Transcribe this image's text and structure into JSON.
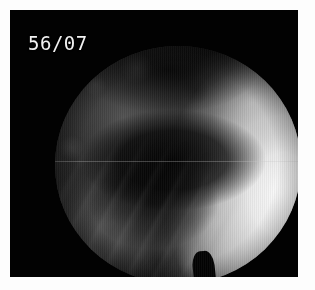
{
  "image": {
    "kind": "endoscopic-still-frame",
    "border_color": "#fdfdfd",
    "frame_color": "#020202"
  },
  "overlay": {
    "counter": "56/07",
    "counter_color": "#f2f2f2"
  },
  "scope_view": {
    "label": "circular endoscopic field of view",
    "shape": "circle",
    "dark_region_label": "shadowed lumen / cavity",
    "bright_region_label": "illuminated mucosal wall",
    "notch_label": "rim notch at bright crescent terminus",
    "artifact_label": "horizontal scanline dropout"
  }
}
